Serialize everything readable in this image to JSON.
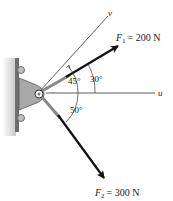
{
  "diagram": {
    "axes": {
      "u": {
        "label": "u"
      },
      "v": {
        "label": "v"
      }
    },
    "forces": [
      {
        "name": "F1",
        "symbol": "F",
        "subscript": "1",
        "equation": "= 200 N",
        "magnitude": 200,
        "unit": "N"
      },
      {
        "name": "F2",
        "symbol": "F",
        "subscript": "2",
        "equation": "= 300 N",
        "magnitude": 300,
        "unit": "N"
      }
    ],
    "angles": [
      {
        "label": "45°",
        "between": "u and v"
      },
      {
        "label": "30°",
        "between": "u and F1"
      },
      {
        "label": "50°",
        "between": "u and F2"
      }
    ],
    "colors": {
      "line": "#333333",
      "arrow": "#111111",
      "bracket": "#9a9a9a",
      "wall": "#6e6e6e"
    }
  }
}
